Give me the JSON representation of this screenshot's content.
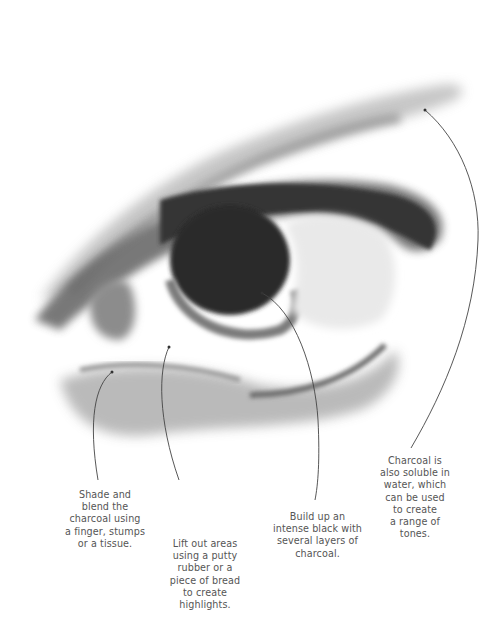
{
  "figure": {
    "colors": {
      "background": "#ffffff",
      "charcoal_dark": "#2e2e2e",
      "charcoal_mid": "#7a7a7a",
      "charcoal_light": "#c9c9c9",
      "leader_line": "#444444",
      "caption_text": "#555555"
    }
  },
  "annotations": [
    {
      "id": "shade",
      "lines": [
        "Shade and",
        "blend the",
        "charcoal using",
        "a finger, stumps",
        "or a tissue."
      ]
    },
    {
      "id": "lift",
      "lines": [
        "Lift out areas",
        "using a putty",
        "rubber or a",
        "piece of bread",
        "to create",
        "highlights."
      ]
    },
    {
      "id": "black",
      "lines": [
        "Build up an",
        "intense black with",
        "several layers of",
        "charcoal."
      ]
    },
    {
      "id": "water",
      "lines": [
        "Charcoal is",
        "also soluble in",
        "water, which",
        "can be used",
        "to create",
        "a range of",
        "tones."
      ]
    }
  ]
}
